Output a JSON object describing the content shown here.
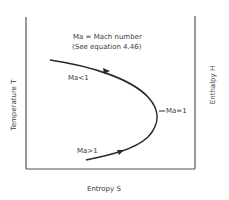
{
  "diagram": {
    "legend": {
      "line1": "Ma = Mach number",
      "line2": "(See equation 4.46)"
    },
    "axes": {
      "x_label": "Entropy  S",
      "y_left_label": "Temperature  T",
      "y_right_label": "Enthalpy  H"
    },
    "curve_labels": {
      "subsonic": "Ma<1",
      "sonic": "Ma=1",
      "supersonic": "Ma>1"
    },
    "colors": {
      "line": "#2a2a2a",
      "frame": "#555555",
      "text": "#3a3a3a"
    }
  }
}
